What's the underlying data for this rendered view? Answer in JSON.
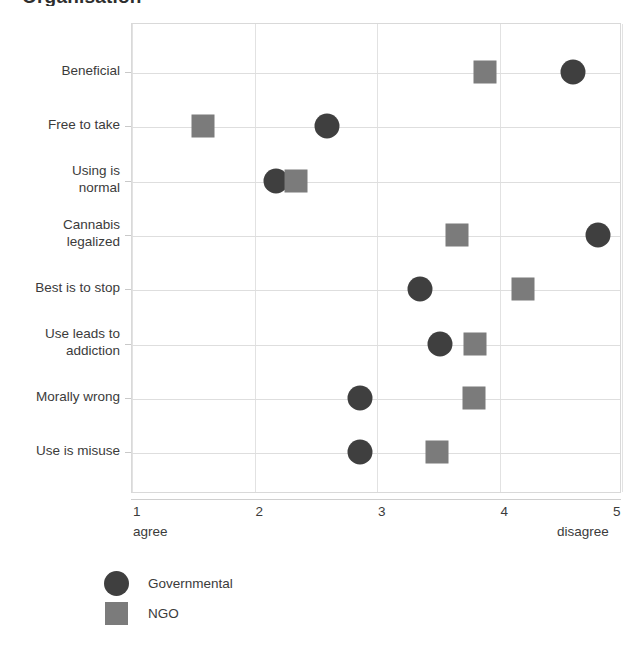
{
  "chart_data": {
    "type": "scatter",
    "title": "Organisation",
    "xlabel": "",
    "ylabel": "",
    "xlim": [
      1,
      5
    ],
    "xticks": [
      1,
      2,
      3,
      4,
      5
    ],
    "xtick_labels": [
      "1",
      "2",
      "3",
      "4",
      "5"
    ],
    "x_low_anchor": "agree",
    "x_high_anchor": "disagree",
    "grid": true,
    "legend_position": "bottom-left",
    "categories": [
      "Beneficial",
      "Free to take",
      "Using is\nnormal",
      "Cannabis\nlegalized",
      "Best is to stop",
      "Use leads to\naddiction",
      "Morally wrong",
      "Use is misuse"
    ],
    "series": [
      {
        "name": "Governmental",
        "marker": "circle",
        "color": "#3f3f3f",
        "values": [
          4.61,
          2.6,
          2.18,
          4.81,
          3.36,
          3.52,
          2.87,
          2.87
        ]
      },
      {
        "name": "NGO",
        "marker": "square",
        "color": "#7b7b7b",
        "values": [
          3.89,
          1.59,
          2.35,
          3.66,
          4.2,
          3.81,
          3.8,
          3.5
        ]
      }
    ]
  },
  "legend": {
    "items": [
      {
        "label": "Governmental",
        "marker": "circle"
      },
      {
        "label": "NGO",
        "marker": "square"
      }
    ]
  }
}
